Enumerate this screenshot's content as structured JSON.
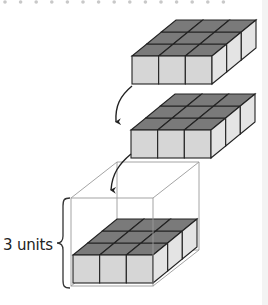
{
  "diagram": {
    "layers": [
      {
        "name": "layer-top",
        "rows": 3,
        "cols": 3,
        "height_units": 1
      },
      {
        "name": "layer-middle",
        "rows": 3,
        "cols": 3,
        "height_units": 1
      },
      {
        "name": "layer-in-box",
        "rows": 3,
        "cols": 3,
        "height_units": 1
      }
    ],
    "box": {
      "height_label": "3 units"
    },
    "colors": {
      "cube_top": "#7a7a7a",
      "cube_front": "#d6d6d6",
      "cube_side": "#e4e4e4",
      "edge": "#222222",
      "box_line": "#9a9a9a",
      "dots": "#c8c8c8"
    },
    "dot_row_count": 15
  }
}
